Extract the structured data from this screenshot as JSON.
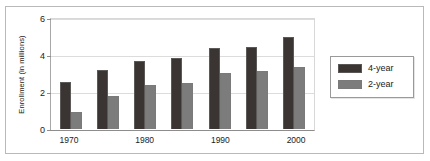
{
  "chart_data": {
    "type": "bar",
    "title": "",
    "subtitle": "",
    "xlabel": "",
    "ylabel": "Enrollment (in millions)",
    "categories": [
      "1970",
      "1975",
      "1980",
      "1985",
      "1990",
      "1995",
      "2000"
    ],
    "visible_tick_labels": [
      "1970",
      "",
      "1980",
      "",
      "1990",
      "",
      "2000"
    ],
    "series": [
      {
        "name": "4-year",
        "color": "#3a3533",
        "values": [
          2.55,
          3.2,
          3.7,
          3.9,
          4.4,
          4.5,
          5.0
        ]
      },
      {
        "name": "2-year",
        "color": "#7c7c7c",
        "values": [
          0.95,
          1.8,
          2.4,
          2.5,
          3.05,
          3.15,
          3.4
        ]
      }
    ],
    "ylim": [
      0,
      6
    ],
    "yticks": [
      0,
      2,
      4,
      6
    ],
    "ytick_labels": [
      "0",
      "2",
      "4",
      "6"
    ],
    "grid": true,
    "legend_position": "right-outside"
  },
  "legend": {
    "entries": [
      {
        "label": "4-year"
      },
      {
        "label": "2-year"
      }
    ]
  }
}
